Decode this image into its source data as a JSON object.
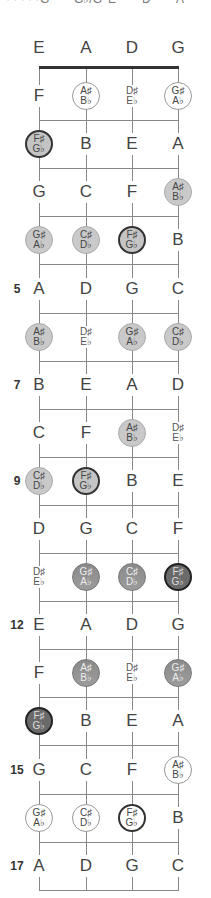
{
  "top_strip_text": [
    "· · · · ·",
    "G",
    "G♭/G",
    "E",
    "D",
    "A"
  ],
  "strings": [
    "E",
    "A",
    "D",
    "G"
  ],
  "fret_numbers": {
    "5": "5",
    "7": "7",
    "9": "9",
    "12": "12",
    "15": "15",
    "17": "17"
  },
  "frets": [
    {
      "fret": 1,
      "notes": [
        {
          "n": "F"
        },
        {
          "s": "A♯",
          "f": "B♭",
          "style": "outline"
        },
        {
          "s": "D♯",
          "f": "E♭"
        },
        {
          "s": "G♯",
          "f": "A♭",
          "style": "outline"
        }
      ]
    },
    {
      "fret": 2,
      "notes": [
        {
          "s": "F♯",
          "f": "G♭",
          "style": "root"
        },
        {
          "n": "B"
        },
        {
          "n": "E"
        },
        {
          "n": "A"
        }
      ]
    },
    {
      "fret": 3,
      "notes": [
        {
          "n": "G"
        },
        {
          "n": "C"
        },
        {
          "n": "F"
        },
        {
          "s": "A♯",
          "f": "B♭",
          "style": "light"
        }
      ]
    },
    {
      "fret": 4,
      "notes": [
        {
          "s": "G♯",
          "f": "A♭",
          "style": "light"
        },
        {
          "s": "C♯",
          "f": "D♭",
          "style": "light"
        },
        {
          "s": "F♯",
          "f": "G♭",
          "style": "root"
        },
        {
          "n": "B"
        }
      ]
    },
    {
      "fret": 5,
      "notes": [
        {
          "n": "A"
        },
        {
          "n": "D"
        },
        {
          "n": "G"
        },
        {
          "n": "C"
        }
      ]
    },
    {
      "fret": 6,
      "notes": [
        {
          "s": "A♯",
          "f": "B♭",
          "style": "light"
        },
        {
          "s": "D♯",
          "f": "E♭"
        },
        {
          "s": "G♯",
          "f": "A♭",
          "style": "light"
        },
        {
          "s": "C♯",
          "f": "D♭",
          "style": "light"
        }
      ]
    },
    {
      "fret": 7,
      "notes": [
        {
          "n": "B"
        },
        {
          "n": "E"
        },
        {
          "n": "A"
        },
        {
          "n": "D"
        }
      ]
    },
    {
      "fret": 8,
      "notes": [
        {
          "n": "C"
        },
        {
          "n": "F"
        },
        {
          "s": "A♯",
          "f": "B♭",
          "style": "light"
        },
        {
          "s": "D♯",
          "f": "E♭"
        }
      ]
    },
    {
      "fret": 9,
      "notes": [
        {
          "s": "C♯",
          "f": "D♭",
          "style": "light"
        },
        {
          "s": "F♯",
          "f": "G♭",
          "style": "root"
        },
        {
          "n": "B"
        },
        {
          "n": "E"
        }
      ]
    },
    {
      "fret": 10,
      "notes": [
        {
          "n": "D"
        },
        {
          "n": "G"
        },
        {
          "n": "C"
        },
        {
          "n": "F"
        }
      ]
    },
    {
      "fret": 11,
      "notes": [
        {
          "s": "D♯",
          "f": "E♭"
        },
        {
          "s": "G♯",
          "f": "A♭",
          "style": "dark"
        },
        {
          "s": "C♯",
          "f": "D♭",
          "style": "dark"
        },
        {
          "s": "F♯",
          "f": "G♭",
          "style": "darkest"
        }
      ]
    },
    {
      "fret": 12,
      "notes": [
        {
          "n": "E"
        },
        {
          "n": "A"
        },
        {
          "n": "D"
        },
        {
          "n": "G"
        }
      ]
    },
    {
      "fret": 13,
      "notes": [
        {
          "n": "F"
        },
        {
          "s": "A♯",
          "f": "B♭",
          "style": "dark"
        },
        {
          "s": "D♯",
          "f": "E♭"
        },
        {
          "s": "G♯",
          "f": "A♭",
          "style": "dark"
        }
      ]
    },
    {
      "fret": 14,
      "notes": [
        {
          "s": "F♯",
          "f": "G♭",
          "style": "darkest"
        },
        {
          "n": "B"
        },
        {
          "n": "E"
        },
        {
          "n": "A"
        }
      ]
    },
    {
      "fret": 15,
      "notes": [
        {
          "n": "G"
        },
        {
          "n": "C"
        },
        {
          "n": "F"
        },
        {
          "s": "A♯",
          "f": "B♭",
          "style": "outline"
        }
      ]
    },
    {
      "fret": 16,
      "notes": [
        {
          "s": "G♯",
          "f": "A♭",
          "style": "outline"
        },
        {
          "s": "C♯",
          "f": "D♭",
          "style": "outline"
        },
        {
          "s": "F♯",
          "f": "G♭",
          "style": "rootw"
        },
        {
          "n": "B"
        }
      ]
    },
    {
      "fret": 17,
      "notes": [
        {
          "n": "A"
        },
        {
          "n": "D"
        },
        {
          "n": "G"
        },
        {
          "n": "C"
        }
      ]
    }
  ]
}
